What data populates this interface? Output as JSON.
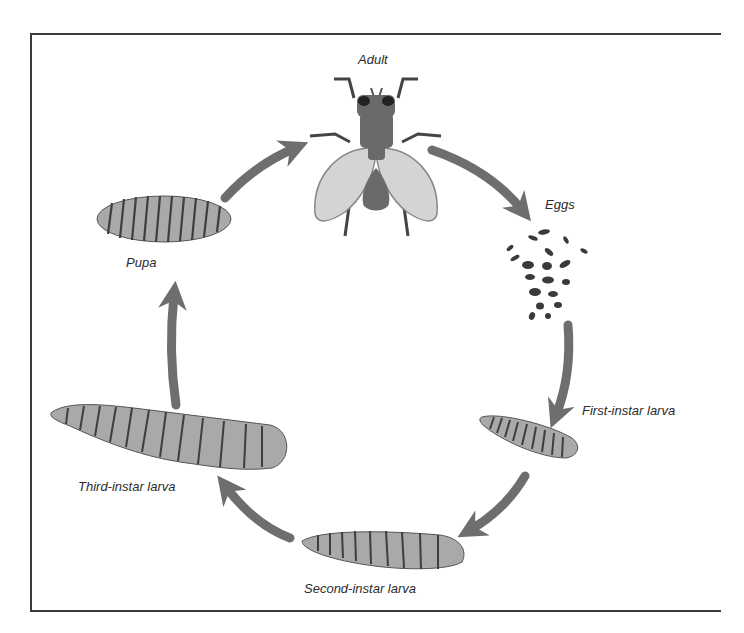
{
  "diagram": {
    "stages": [
      {
        "id": "adult",
        "label": "Adult"
      },
      {
        "id": "eggs",
        "label": "Eggs"
      },
      {
        "id": "first-instar",
        "label": "First-instar larva"
      },
      {
        "id": "second-instar",
        "label": "Second-instar larva"
      },
      {
        "id": "third-instar",
        "label": "Third-instar larva"
      },
      {
        "id": "pupa",
        "label": "Pupa"
      }
    ],
    "cycle_order": [
      "Adult",
      "Eggs",
      "First-instar larva",
      "Second-instar larva",
      "Third-instar larva",
      "Pupa"
    ],
    "colors": {
      "arrow": "#6e6e6e",
      "body_dark": "#6a6a6a",
      "wing": "#d4d4d4",
      "larva_fill": "#a9a9a9",
      "segment_line": "#3e3e3e",
      "frame": "#3a3a3a"
    }
  }
}
